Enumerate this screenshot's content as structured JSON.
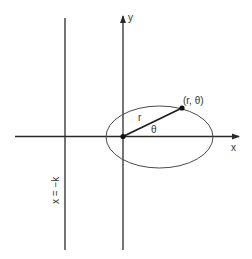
{
  "diagram": {
    "labels": {
      "y_axis": "y",
      "x_axis": "x",
      "point": "(r, θ)",
      "radius": "r",
      "angle": "θ",
      "directrix": "x = −k"
    },
    "colors": {
      "line": "#2a2a2a",
      "ellipse": "#4a4a4a",
      "text": "#333333",
      "background": "#ffffff"
    }
  }
}
